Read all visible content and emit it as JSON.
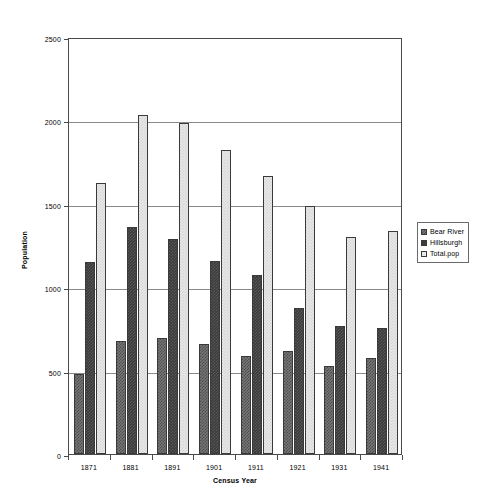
{
  "chart_data": {
    "type": "bar",
    "title": "",
    "subtitle": "",
    "xlabel": "Census Year",
    "ylabel": "Population",
    "categories": [
      "1871",
      "1881",
      "1891",
      "1901",
      "1911",
      "1921",
      "1931",
      "1941"
    ],
    "series": [
      {
        "name": "Bear River",
        "values": [
          480,
          675,
          695,
          660,
          585,
          615,
          525,
          575
        ],
        "color": "#767676"
      },
      {
        "name": "Hillsburgh",
        "values": [
          1150,
          1360,
          1290,
          1160,
          1075,
          875,
          770,
          755
        ],
        "color": "#3b3b3b"
      },
      {
        "name": "Total.pop",
        "values": [
          1625,
          2035,
          1985,
          1820,
          1665,
          1485,
          1300,
          1340
        ],
        "color": "#e8e8e8"
      }
    ],
    "ylim": [
      0,
      2500
    ],
    "yticks": [
      0,
      500,
      1000,
      1500,
      2000,
      2500
    ],
    "ytick_labels": [
      "0",
      "500",
      "1000",
      "1500",
      "2000",
      "2500"
    ],
    "grid": true,
    "grid_axis": "y",
    "legend_position": "right",
    "plot_background": "#ffffff",
    "frame_color": "#4a4a4a",
    "gridline_color": "#8a8a8a"
  },
  "legend": {
    "entries": [
      {
        "label": "Bear River"
      },
      {
        "label": "Hillsburgh"
      },
      {
        "label": "Total.pop"
      }
    ]
  },
  "axes": {
    "x_title": "Census Year",
    "y_title": "Population"
  }
}
